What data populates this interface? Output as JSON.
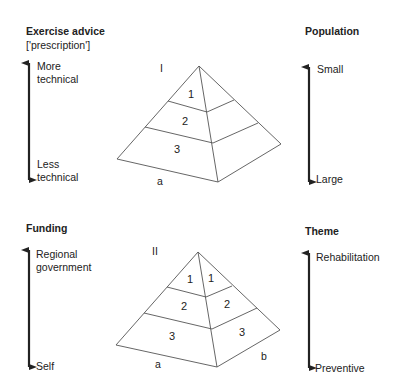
{
  "top": {
    "left_axis": {
      "title": "Exercise advice",
      "subtitle": "['prescription']",
      "top_label_line1": "More",
      "top_label_line2": "technical",
      "bottom_label_line1": "Less",
      "bottom_label_line2": "technical"
    },
    "right_axis": {
      "title": "Population",
      "top_label": "Small",
      "bottom_label": "Large"
    },
    "pyramid": {
      "roman": "I",
      "tiers_front": [
        "1",
        "2",
        "3"
      ],
      "side_label": "a"
    }
  },
  "bottom": {
    "left_axis": {
      "title": "Funding",
      "top_label_line1": "Regional",
      "top_label_line2": "government",
      "bottom_label": "Self"
    },
    "right_axis": {
      "title": "Theme",
      "top_label": "Rehabilitation",
      "bottom_label": "Preventive"
    },
    "pyramid": {
      "roman": "II",
      "tiers_front": [
        "1",
        "2",
        "3"
      ],
      "tiers_side": [
        "1",
        "2",
        "3"
      ],
      "side_label_front": "a",
      "side_label_right": "b"
    }
  },
  "colors": {
    "line": "#555555",
    "arrow": "#222222",
    "text": "#222222"
  }
}
